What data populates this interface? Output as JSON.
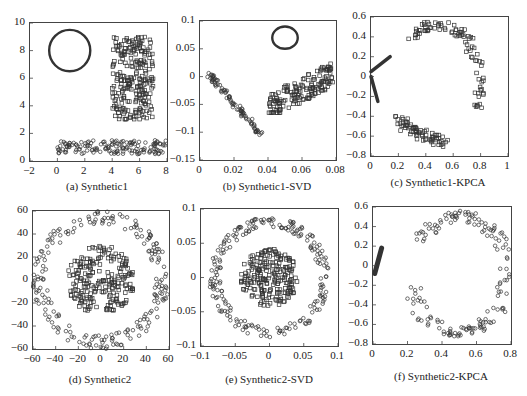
{
  "chart_data": [
    {
      "id": "a",
      "type": "scatter",
      "title": "(a) Synthetic1",
      "xlim": [
        -2,
        8
      ],
      "ylim": [
        0,
        10
      ],
      "xticks": [
        "-2",
        "0",
        "2",
        "4",
        "6",
        "8"
      ],
      "yticks": [
        "0",
        "2",
        "4",
        "6",
        "8",
        "10"
      ],
      "grid": false,
      "series": [
        {
          "name": "circle ring",
          "marker": "dense-ring",
          "shape": "circle",
          "cx": 0.9,
          "cy": 8.0,
          "r": 1.5
        },
        {
          "name": "rectangle cluster (squares)",
          "marker": "square",
          "region": {
            "x": [
              4,
              7
            ],
            "y": [
              3,
              9
            ]
          },
          "approx_points": 250
        },
        {
          "name": "bottom band (circles)",
          "marker": "circle",
          "region": {
            "x": [
              0,
              8
            ],
            "y": [
              0.5,
              1.5
            ]
          },
          "approx_points": 150
        }
      ]
    },
    {
      "id": "b",
      "type": "scatter",
      "title": "(b) Synthetic1-SVD",
      "xlim": [
        0,
        0.08
      ],
      "ylim": [
        -0.15,
        0.1
      ],
      "xticks": [
        "0",
        "0.02",
        "0.04",
        "0.06",
        "0.08"
      ],
      "yticks": [
        "-0.15",
        "-0.1",
        "-0.05",
        "0",
        "0.05",
        "0.1"
      ],
      "grid": false,
      "series": [
        {
          "name": "ellipse ring",
          "marker": "dense-ring",
          "shape": "ellipse",
          "cx": 0.05,
          "cy": 0.07,
          "rx": 0.0075,
          "ry": 0.02
        },
        {
          "name": "diagonal line cluster (circles)",
          "marker": "circle",
          "from": [
            0.005,
            0.005
          ],
          "to": [
            0.036,
            -0.105
          ]
        },
        {
          "name": "parallelogram cluster (squares)",
          "marker": "square",
          "region": {
            "x": [
              0.04,
              0.078
            ],
            "y": [
              -0.065,
              0.03
            ]
          }
        }
      ]
    },
    {
      "id": "c",
      "type": "scatter",
      "title": "(c) Synthetic1-KPCA",
      "xlim": [
        0,
        1
      ],
      "ylim": [
        -0.8,
        0.6
      ],
      "xticks": [
        "0",
        "0.2",
        "0.4",
        "0.6",
        "0.8",
        "1"
      ],
      "yticks": [
        "-0.8",
        "-0.6",
        "-0.4",
        "-0.2",
        "0",
        "0.2",
        "0.4",
        "0.6"
      ],
      "grid": false,
      "series": [
        {
          "name": "thin line cluster 1",
          "marker": "dense-line",
          "from": [
            0.0,
            0.05
          ],
          "to": [
            0.14,
            0.2
          ]
        },
        {
          "name": "thin line cluster 2",
          "marker": "dense-line",
          "from": [
            0.0,
            0.0
          ],
          "to": [
            0.05,
            -0.25
          ]
        },
        {
          "name": "S-shaped curve (squares)",
          "marker": "square",
          "region": {
            "x": [
              0.18,
              0.82
            ],
            "y": [
              -0.75,
              0.55
            ]
          }
        }
      ]
    },
    {
      "id": "d",
      "type": "scatter",
      "title": "(d) Synthetic2",
      "xlim": [
        -60,
        60
      ],
      "ylim": [
        -60,
        60
      ],
      "xticks": [
        "-60",
        "-40",
        "-20",
        "0",
        "20",
        "40",
        "60"
      ],
      "yticks": [
        "-60",
        "-40",
        "-20",
        "0",
        "20",
        "40",
        "60"
      ],
      "grid": false,
      "series": [
        {
          "name": "outer ring (circles)",
          "marker": "circle",
          "shape": "annulus",
          "cx": 0,
          "cy": 0,
          "r_inner": 48,
          "r_outer": 60
        },
        {
          "name": "inner disk (squares)",
          "marker": "square",
          "shape": "disk",
          "cx": 0,
          "cy": 0,
          "r": 30
        }
      ]
    },
    {
      "id": "e",
      "type": "scatter",
      "title": "(e) Synthetic2-SVD",
      "xlim": [
        -0.1,
        0.1
      ],
      "ylim": [
        -0.1,
        0.1
      ],
      "xticks": [
        "-0.1",
        "-0.05",
        "0",
        "0.05",
        "0.1"
      ],
      "yticks": [
        "-0.1",
        "-0.05",
        "0",
        "0.05",
        "0.1"
      ],
      "grid": false,
      "series": [
        {
          "name": "outer ring (circles)",
          "marker": "circle",
          "shape": "annulus",
          "cx": 0,
          "cy": 0,
          "r_inner": 0.072,
          "r_outer": 0.088
        },
        {
          "name": "inner disk (squares)",
          "marker": "square",
          "shape": "disk",
          "cx": 0,
          "cy": 0,
          "r": 0.042
        }
      ]
    },
    {
      "id": "f",
      "type": "scatter",
      "title": "(f) Synthetic2-KPCA",
      "xlim": [
        0,
        0.8
      ],
      "ylim": [
        -0.8,
        0.6
      ],
      "xticks": [
        "0",
        "0.2",
        "0.4",
        "0.6",
        "0.8"
      ],
      "yticks": [
        "-0.8",
        "-0.6",
        "-0.4",
        "-0.2",
        "0",
        "0.2",
        "0.4",
        "0.6"
      ],
      "grid": false,
      "series": [
        {
          "name": "dense cluster near origin",
          "marker": "dense-line",
          "from": [
            0.01,
            -0.08
          ],
          "to": [
            0.05,
            0.18
          ]
        },
        {
          "name": "C-shaped ring (circles)",
          "marker": "circle",
          "region": {
            "x": [
              0.2,
              0.79
            ],
            "y": [
              -0.72,
              0.56
            ]
          }
        }
      ]
    }
  ],
  "panels": {
    "a": {
      "caption": "(a) Synthetic1"
    },
    "b": {
      "caption": "(b) Synthetic1-SVD"
    },
    "c": {
      "caption": "(c) Synthetic1-KPCA"
    },
    "d": {
      "caption": "(d) Synthetic2"
    },
    "e": {
      "caption": "(e) Synthetic2-SVD"
    },
    "f": {
      "caption": "(f) Synthetic2-KPCA"
    }
  },
  "style": {
    "axis_color": "#444444",
    "marker_color": "#333333"
  }
}
